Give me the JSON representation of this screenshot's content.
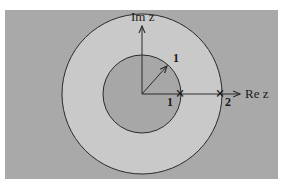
{
  "figure": {
    "type": "complex-plane-annulus",
    "colors": {
      "page_background": "#ffffff",
      "frame_background": "#a9a9a9",
      "annulus_fill": "#c9c9c9",
      "inner_disk_fill": "#a7a7a7",
      "stroke": "#2a2a2a"
    },
    "axes": {
      "imaginary_label": "Im z",
      "real_label": "Re z"
    },
    "inner_circle": {
      "radius_label": "1"
    },
    "points": [
      {
        "label": "1",
        "marker": "×"
      },
      {
        "label": "2",
        "marker": "×"
      }
    ]
  }
}
